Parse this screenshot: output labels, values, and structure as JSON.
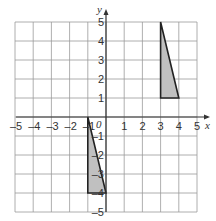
{
  "diagram": {
    "type": "coordinate-grid",
    "x_axis_label": "x",
    "y_axis_label": "y",
    "origin_label": "0",
    "x_range": [
      -5,
      5
    ],
    "y_range": [
      -5,
      5
    ],
    "x_tick_labels": [
      "-5",
      "-4",
      "-3",
      "-2",
      "-1",
      "1",
      "2",
      "3",
      "4",
      "5"
    ],
    "y_tick_labels": [
      "5",
      "4",
      "3",
      "2",
      "1",
      "-1",
      "-2",
      "-3",
      "-4",
      "-5"
    ],
    "colors": {
      "grid": "#9a9a9a",
      "axis": "#333333",
      "shape_fill": "#c0c0c0",
      "shape_stroke": "#222222"
    },
    "shapes": [
      {
        "name": "triangle-A",
        "vertices": [
          [
            3,
            5
          ],
          [
            3,
            1
          ],
          [
            4,
            1
          ]
        ]
      },
      {
        "name": "triangle-B",
        "vertices": [
          [
            -1,
            0
          ],
          [
            -1,
            -4
          ],
          [
            0,
            -4
          ]
        ]
      }
    ]
  }
}
